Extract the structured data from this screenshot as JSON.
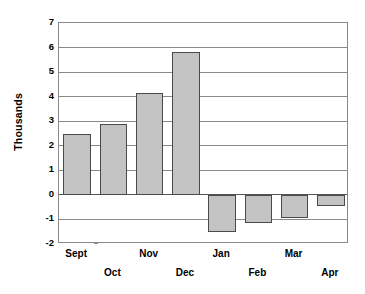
{
  "chart_data": {
    "type": "bar",
    "title": "",
    "subtitle": "",
    "xlabel": "",
    "ylabel": "Thousands",
    "categories": [
      "Sept",
      "Oct",
      "Nov",
      "Dec",
      "Jan",
      "Feb",
      "Mar",
      "Apr"
    ],
    "values": [
      2.5,
      2.9,
      4.15,
      5.83,
      -1.5,
      -1.15,
      -0.95,
      -0.45
    ],
    "series": [
      {
        "name": "",
        "values": [
          2.5,
          2.9,
          4.15,
          5.83,
          -1.5,
          -1.15,
          -0.95,
          -0.45
        ]
      }
    ],
    "ylim": [
      -2,
      7
    ],
    "ytick_labels": [
      "7",
      "6",
      "5",
      "4",
      "3",
      "2",
      "1",
      "0",
      "-1",
      "-2"
    ],
    "ytick_values": [
      7,
      6,
      5,
      4,
      3,
      2,
      1,
      0,
      -1,
      -2
    ],
    "grid": true,
    "grid_axis": "y",
    "legend": false,
    "legend_position": "none",
    "annotations": [],
    "bar_fill_color": "#c3c3c3",
    "bar_border_color": "#4a4a4a",
    "grid_color": "#8a8a8a",
    "zero_line_color": "#555555",
    "background_color": "#ffffff",
    "text_color": "#000000",
    "xtick_label_rows": [
      {
        "row": "top",
        "labels": [
          "Sept",
          "Nov",
          "Jan",
          "Mar"
        ]
      },
      {
        "row": "bottom",
        "labels": [
          "Oct",
          "Dec",
          "Feb",
          "Apr"
        ]
      }
    ]
  }
}
